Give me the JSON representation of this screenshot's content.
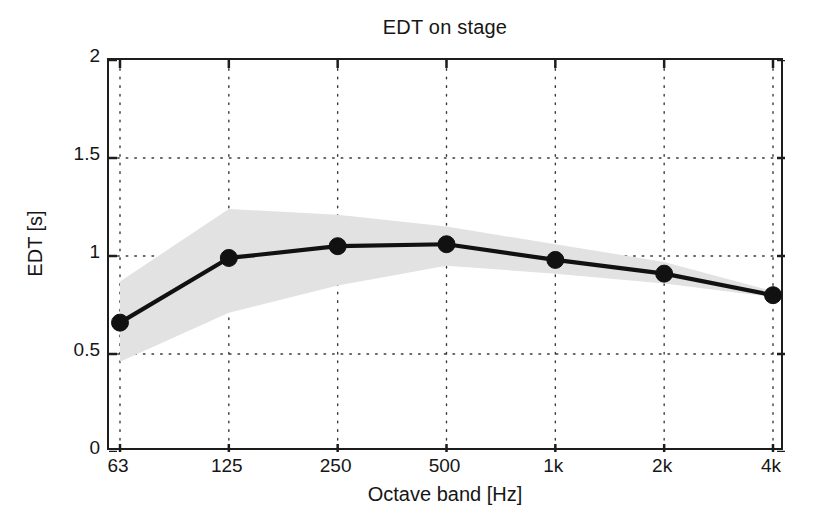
{
  "chart_data": {
    "type": "line",
    "title": "EDT on stage",
    "xlabel": "Octave band [Hz]",
    "ylabel": "EDT [s]",
    "categories": [
      "63",
      "125",
      "250",
      "500",
      "1k",
      "2k",
      "4k"
    ],
    "values": [
      0.66,
      0.99,
      1.05,
      1.06,
      0.98,
      0.91,
      0.8
    ],
    "series": [
      {
        "name": "EDT mean",
        "values": [
          0.66,
          0.99,
          1.05,
          1.06,
          0.98,
          0.91,
          0.8
        ]
      }
    ],
    "band": {
      "name": "spread",
      "upper": [
        0.87,
        1.24,
        1.21,
        1.15,
        1.06,
        0.97,
        0.82
      ],
      "lower": [
        0.46,
        0.71,
        0.85,
        0.95,
        0.91,
        0.86,
        0.79
      ],
      "color": "#e2e2e2"
    },
    "ylim": [
      0,
      2
    ],
    "yticks": [
      "0",
      "0.5",
      "1",
      "1.5",
      "2"
    ],
    "ytick_values": [
      0,
      0.5,
      1,
      1.5,
      2
    ],
    "grid": "dotted",
    "legend": "none",
    "line_color": "#111111",
    "marker": "circle",
    "marker_color": "#111111"
  }
}
